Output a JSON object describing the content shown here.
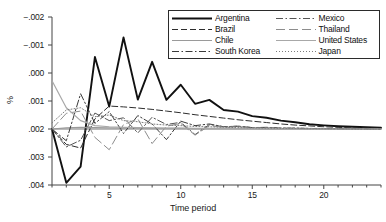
{
  "chart_data": {
    "type": "line",
    "title": "",
    "xlabel": "Time period",
    "ylabel": "%",
    "xlim": [
      1,
      24
    ],
    "ylim": [
      -0.002,
      0.004
    ],
    "grid": false,
    "legend_position": "top-right",
    "x": [
      1,
      2,
      3,
      4,
      5,
      6,
      7,
      8,
      9,
      10,
      11,
      12,
      13,
      14,
      15,
      16,
      17,
      18,
      19,
      20,
      21,
      22,
      23,
      24
    ],
    "xticks": [
      5,
      10,
      15,
      20
    ],
    "xtick_labels": [
      "5",
      "10",
      "15",
      "20"
    ],
    "yticks": [
      -0.002,
      -0.001,
      0.0,
      0.001,
      0.002,
      0.003,
      0.004
    ],
    "ytick_labels": [
      ".004",
      ".003",
      ".002",
      ".001",
      ".000",
      "−.001",
      "−.002"
    ],
    "series": [
      {
        "name": "Argentina",
        "style": "solid",
        "color": "#111111",
        "width": 1.9,
        "values": [
          0.0,
          -0.00192,
          -0.00134,
          0.00257,
          0.0008,
          0.00327,
          0.00105,
          0.0024,
          0.00104,
          0.00158,
          0.0009,
          0.00104,
          0.00068,
          0.00062,
          0.00046,
          0.0004,
          0.0003,
          0.00024,
          0.00017,
          0.00013,
          0.0001,
          8e-05,
          6e-05,
          5e-05
        ]
      },
      {
        "name": "Brazil",
        "style": "dashed",
        "color": "#2d2d2d",
        "width": 1.0,
        "values": [
          0.0,
          -0.00055,
          -0.00068,
          0.00036,
          0.00082,
          0.00079,
          0.00075,
          0.0007,
          0.00064,
          0.00058,
          0.00051,
          0.00045,
          0.00039,
          0.00033,
          0.00028,
          0.00023,
          0.00018,
          0.00014,
          0.00011,
          8e-05,
          6e-05,
          4e-05,
          3e-05,
          2e-05
        ]
      },
      {
        "name": "Chile",
        "style": "solid",
        "color": "#9a9a9a",
        "width": 1.2,
        "values": [
          0.0,
          4e-05,
          6e-05,
          5e-05,
          4e-05,
          3e-05,
          3e-05,
          2e-05,
          2e-05,
          2e-05,
          1e-05,
          1e-05,
          1e-05,
          1e-05,
          1e-05,
          0.0,
          0.0,
          0.0,
          0.0,
          0.0,
          0.0,
          0.0,
          0.0,
          0.0
        ]
      },
      {
        "name": "South Korea",
        "style": "dashdot",
        "color": "#3a3a3a",
        "width": 1.0,
        "values": [
          0.0,
          -0.00042,
          0.00126,
          0.0002,
          0.00062,
          -0.00016,
          0.00048,
          0.00018,
          -0.00038,
          0.00028,
          0.00012,
          0.00018,
          8e-05,
          0.0001,
          5e-05,
          6e-05,
          3e-05,
          3e-05,
          2e-05,
          2e-05,
          1e-05,
          1e-05,
          1e-05,
          0.0
        ]
      },
      {
        "name": "Mexico",
        "style": "dashdot",
        "color": "#555555",
        "width": 1.0,
        "values": [
          0.0,
          -0.00064,
          -0.0004,
          0.00057,
          0.0003,
          0.0004,
          -0.00014,
          0.00042,
          0.00016,
          0.00024,
          -0.0002,
          0.00016,
          8e-05,
          0.0001,
          5e-05,
          5e-05,
          3e-05,
          3e-05,
          2e-05,
          1e-05,
          1e-05,
          1e-05,
          0.0,
          0.0
        ]
      },
      {
        "name": "Thailand",
        "style": "longdash",
        "color": "#8d8d8d",
        "width": 1.0,
        "values": [
          0.0,
          0.00056,
          0.00064,
          -0.0003,
          -0.00074,
          0.00016,
          0.00036,
          -0.00052,
          0.0001,
          0.0002,
          -0.00022,
          0.00012,
          6e-05,
          8e-05,
          4e-05,
          4e-05,
          2e-05,
          2e-05,
          1e-05,
          1e-05,
          1e-05,
          0.0,
          0.0,
          0.0
        ]
      },
      {
        "name": "United States",
        "style": "solid",
        "color": "#a8a8a8",
        "width": 1.2,
        "values": [
          0.00172,
          0.00076,
          0.0003,
          0.00012,
          8e-05,
          6e-05,
          5e-05,
          4e-05,
          3e-05,
          3e-05,
          2e-05,
          2e-05,
          2e-05,
          1e-05,
          1e-05,
          1e-05,
          1e-05,
          0.0,
          0.0,
          0.0,
          0.0,
          0.0,
          0.0,
          0.0
        ]
      },
      {
        "name": "Japan",
        "style": "dotted",
        "color": "#7d7d7d",
        "width": 1.0,
        "values": [
          0.00022,
          0.00068,
          0.00076,
          0.00044,
          0.0005,
          0.0003,
          0.00026,
          0.00018,
          0.00014,
          0.00012,
          9e-05,
          8e-05,
          6e-05,
          5e-05,
          4e-05,
          3e-05,
          2e-05,
          2e-05,
          1e-05,
          1e-05,
          1e-05,
          0.0,
          0.0,
          0.0
        ]
      }
    ]
  }
}
